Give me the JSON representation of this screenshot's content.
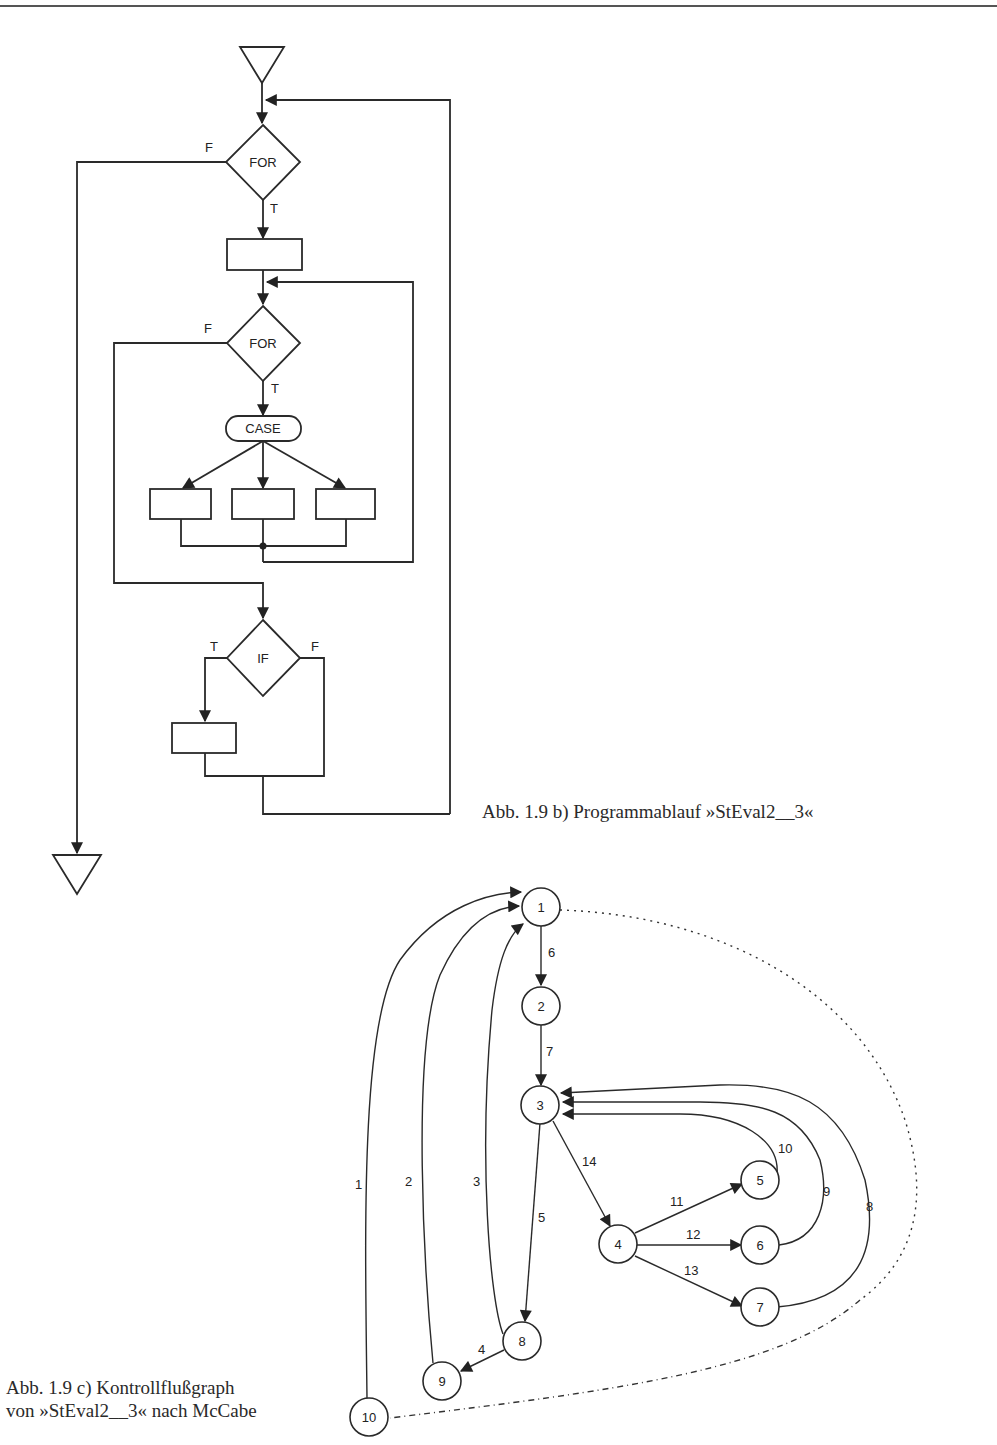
{
  "flowchart": {
    "start_symbol": "start-triangle",
    "end_symbol": "end-triangle",
    "decisions": [
      {
        "id": "for_outer",
        "label": "FOR",
        "true_label": "T",
        "false_label": "F"
      },
      {
        "id": "for_inner",
        "label": "FOR",
        "true_label": "T",
        "false_label": "F"
      },
      {
        "id": "if",
        "label": "IF",
        "true_label": "T",
        "false_label": "F"
      }
    ],
    "case_label": "CASE",
    "caption": "Abb. 1.9 b) Programmablauf »StEval2__3«"
  },
  "graph": {
    "nodes": [
      "1",
      "2",
      "3",
      "4",
      "5",
      "6",
      "7",
      "8",
      "9",
      "10"
    ],
    "edges": [
      {
        "label": "1",
        "from": "10",
        "to": "1"
      },
      {
        "label": "2",
        "from": "9",
        "to": "1"
      },
      {
        "label": "3",
        "from": "8",
        "to": "1"
      },
      {
        "label": "4",
        "from": "8",
        "to": "9"
      },
      {
        "label": "5",
        "from": "3",
        "to": "8"
      },
      {
        "label": "6",
        "from": "1",
        "to": "2"
      },
      {
        "label": "7",
        "from": "2",
        "to": "3"
      },
      {
        "label": "8",
        "from": "7",
        "to": "3"
      },
      {
        "label": "9",
        "from": "6",
        "to": "3"
      },
      {
        "label": "10",
        "from": "5",
        "to": "3"
      },
      {
        "label": "11",
        "from": "4",
        "to": "5"
      },
      {
        "label": "12",
        "from": "4",
        "to": "6"
      },
      {
        "label": "13",
        "from": "4",
        "to": "7"
      },
      {
        "label": "14",
        "from": "3",
        "to": "4"
      }
    ],
    "virtual_edge": {
      "from": "1",
      "to": "10",
      "style": "dotted"
    },
    "caption_line1": "Abb. 1.9 c) Kontrollflußgraph",
    "caption_line2": "von »StEval2__3« nach McCabe"
  }
}
